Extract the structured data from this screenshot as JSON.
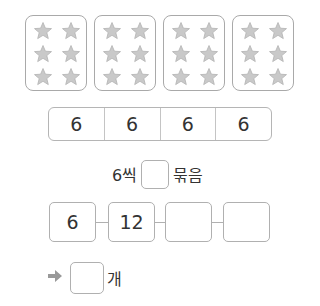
{
  "star_groups": [
    {
      "count": 6
    },
    {
      "count": 6
    },
    {
      "count": 6
    },
    {
      "count": 6
    }
  ],
  "colors": {
    "star_fill": "#c9c9c9",
    "star_edge": "#b3b3b3",
    "box_border": "#a9a9a9",
    "arrow": "#999999"
  },
  "strip": {
    "cells": [
      "6",
      "6",
      "6",
      "6"
    ]
  },
  "grouping": {
    "prefix": "6씩",
    "blank_value": "",
    "suffix": "묶음"
  },
  "skip_count_chain": {
    "values": [
      "6",
      "12",
      "",
      ""
    ]
  },
  "answer": {
    "arrow_icon": "right-arrow-icon",
    "blank_value": "",
    "unit": "개"
  }
}
